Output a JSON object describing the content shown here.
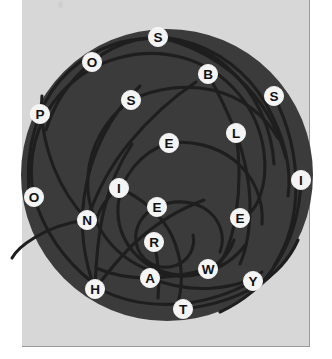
{
  "canvas": {
    "width": 332,
    "height": 359
  },
  "panel": {
    "background_color": "#d7d7d7",
    "border_color": "#9a9a9a",
    "x": 22,
    "y": 0,
    "width": 288,
    "height": 347
  },
  "puzzle": {
    "name": "spiral-letter-puzzle",
    "disc": {
      "center_x": 167,
      "center_y": 175,
      "radius": 146,
      "fill_color": "#3b3b3b"
    },
    "arm_color": "#1e1e1e",
    "node_fill_color": "#f4f4f4",
    "node_text_color": "#111111",
    "node_radius": 9.6,
    "letters": [
      {
        "id": "node-s-top",
        "label": "S",
        "x": 158,
        "y": 37
      },
      {
        "id": "node-o-upper",
        "label": "O",
        "x": 92,
        "y": 62
      },
      {
        "id": "node-b",
        "label": "B",
        "x": 208,
        "y": 74
      },
      {
        "id": "node-s-mid",
        "label": "S",
        "x": 131,
        "y": 100
      },
      {
        "id": "node-s-right",
        "label": "S",
        "x": 274,
        "y": 96
      },
      {
        "id": "node-p",
        "label": "P",
        "x": 40,
        "y": 114
      },
      {
        "id": "node-l",
        "label": "L",
        "x": 236,
        "y": 133
      },
      {
        "id": "node-e-center",
        "label": "E",
        "x": 169,
        "y": 143
      },
      {
        "id": "node-i-right",
        "label": "I",
        "x": 301,
        "y": 180
      },
      {
        "id": "node-o-left",
        "label": "O",
        "x": 34,
        "y": 197
      },
      {
        "id": "node-i-inner",
        "label": "I",
        "x": 119,
        "y": 188
      },
      {
        "id": "node-e-inner",
        "label": "E",
        "x": 157,
        "y": 207
      },
      {
        "id": "node-n",
        "label": "N",
        "x": 87,
        "y": 220
      },
      {
        "id": "node-e-right",
        "label": "E",
        "x": 240,
        "y": 218
      },
      {
        "id": "node-r",
        "label": "R",
        "x": 154,
        "y": 242
      },
      {
        "id": "node-w",
        "label": "W",
        "x": 208,
        "y": 269
      },
      {
        "id": "node-a",
        "label": "A",
        "x": 150,
        "y": 278
      },
      {
        "id": "node-y",
        "label": "Y",
        "x": 253,
        "y": 281
      },
      {
        "id": "node-h",
        "label": "H",
        "x": 95,
        "y": 289
      },
      {
        "id": "node-t",
        "label": "T",
        "x": 183,
        "y": 309
      }
    ]
  }
}
